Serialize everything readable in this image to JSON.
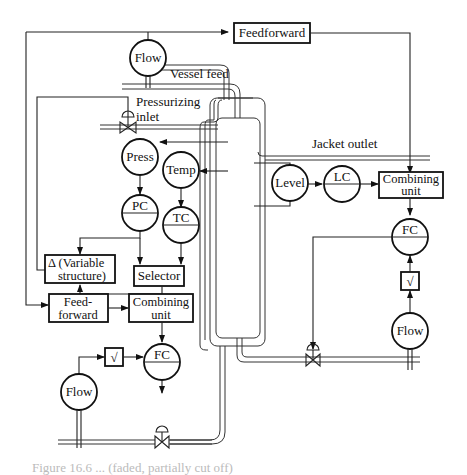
{
  "diagram": {
    "type": "process-control-schematic",
    "labels": {
      "vessel_feed": "Vessel feed",
      "pressurizing_inlet_line1": "Pressurizing",
      "pressurizing_inlet_line2": "inlet",
      "jacket_outlet": "Jacket outlet"
    },
    "instruments": {
      "flow_top": "Flow",
      "press": "Press",
      "temp": "Temp",
      "pc": "PC",
      "tc": "TC",
      "level": "Level",
      "lc": "LC",
      "fc_right": "FC",
      "flow_right": "Flow",
      "fc_bottom": "FC",
      "flow_bottom": "Flow"
    },
    "blocks": {
      "feedforward_top": "Feedforward",
      "combining_right_line1": "Combining",
      "combining_right_line2": "unit",
      "variable_structure_line1": "Δ (Variable",
      "variable_structure_line2": "structure)",
      "selector": "Selector",
      "feedforward_bottom_line1": "Feed-",
      "feedforward_bottom_line2": "forward",
      "combining_bottom_line1": "Combining",
      "combining_bottom_line2": "unit",
      "sqrt_right": "√",
      "sqrt_bottom": "√"
    },
    "caption": "Figure 16.6 ... (faded, partially cut off)"
  }
}
